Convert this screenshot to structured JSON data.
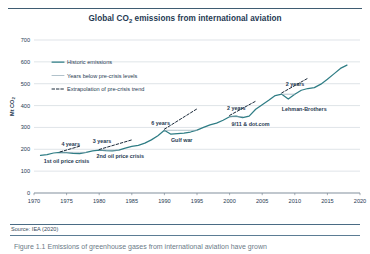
{
  "figure": {
    "title": "Global CO2 emissions from international aviation",
    "title_main": "Global CO",
    "title_sub": "2",
    "title_rest": " emissions from international aviation",
    "source": "Source: IEA (2020)",
    "caption": "Figure 1.1 Emissions of greenhouse gases from international aviation have grown",
    "accent_color": "#2f7d85",
    "line_color": "#2f7d85",
    "dash_color": "#1b2a3a",
    "grid_color": "#c9d2d9",
    "text_color": "#1f3a52"
  },
  "chart_data": {
    "type": "line",
    "title": "Global CO2 emissions from international aviation",
    "xlabel": "",
    "ylabel": "Mt CO2",
    "ylabel_main": "Mt CO",
    "ylabel_sub": "2",
    "xlim": [
      1970,
      2020
    ],
    "ylim": [
      0,
      700
    ],
    "xticks": [
      1970,
      1975,
      1980,
      1985,
      1990,
      1995,
      2000,
      2005,
      2010,
      2015,
      2020
    ],
    "yticks": [
      0,
      100,
      200,
      300,
      400,
      500,
      600,
      700
    ],
    "grid": "horizontal",
    "legend_position": "upper-left",
    "legend": [
      {
        "label": "Historic emissions",
        "style": "solid",
        "color": "#2f7d85"
      },
      {
        "label": "Years below pre-crisis levels",
        "style": "solid-thin",
        "color": "#8fa7b4"
      },
      {
        "label": "Extrapolation of pre-crisis trend",
        "style": "dashed",
        "color": "#1b2a3a"
      }
    ],
    "series": [
      {
        "name": "Historic emissions",
        "style": "solid",
        "color": "#2f7d85",
        "x": [
          1971,
          1972,
          1973,
          1974,
          1975,
          1976,
          1977,
          1978,
          1979,
          1980,
          1981,
          1982,
          1983,
          1984,
          1985,
          1986,
          1987,
          1988,
          1989,
          1990,
          1991,
          1992,
          1993,
          1994,
          1995,
          1996,
          1997,
          1998,
          1999,
          2000,
          2001,
          2002,
          2003,
          2004,
          2005,
          2006,
          2007,
          2008,
          2009,
          2010,
          2011,
          2012,
          2013,
          2014,
          2015,
          2016,
          2017,
          2018
        ],
        "y": [
          172,
          176,
          183,
          186,
          185,
          181,
          180,
          186,
          193,
          196,
          194,
          193,
          196,
          205,
          213,
          218,
          228,
          243,
          262,
          287,
          269,
          272,
          274,
          279,
          288,
          300,
          312,
          320,
          333,
          349,
          352,
          345,
          352,
          383,
          404,
          424,
          446,
          452,
          430,
          452,
          470,
          478,
          482,
          498,
          520,
          545,
          570,
          585
        ]
      },
      {
        "name": "Years below pre-crisis levels (1st oil price crisis)",
        "style": "solid-thin",
        "color": "#8fa7b4",
        "x": [
          1974,
          1975,
          1976,
          1977,
          1978
        ],
        "y": [
          186,
          186,
          186,
          186,
          186
        ]
      },
      {
        "name": "Years below pre-crisis levels (2nd oil price crisis)",
        "style": "solid-thin",
        "color": "#8fa7b4",
        "x": [
          1980,
          1981,
          1982,
          1983
        ],
        "y": [
          196,
          196,
          196,
          196
        ]
      },
      {
        "name": "Years below pre-crisis levels (Gulf war)",
        "style": "solid-thin",
        "color": "#8fa7b4",
        "x": [
          1990,
          1991,
          1992,
          1993,
          1994,
          1995
        ],
        "y": [
          287,
          287,
          287,
          287,
          287,
          287
        ]
      },
      {
        "name": "Years below pre-crisis levels (9/11 & dot.com)",
        "style": "solid-thin",
        "color": "#8fa7b4",
        "x": [
          2000,
          2001,
          2002
        ],
        "y": [
          349,
          349,
          349
        ]
      },
      {
        "name": "Years below pre-crisis levels (Lehman-Brothers)",
        "style": "solid-thin",
        "color": "#8fa7b4",
        "x": [
          2008,
          2009,
          2010
        ],
        "y": [
          452,
          452,
          452
        ]
      },
      {
        "name": "Extrapolation of pre-crisis trend (1st oil price crisis)",
        "style": "dashed",
        "color": "#1b2a3a",
        "x": [
          1974,
          1977
        ],
        "y": [
          188,
          214
        ]
      },
      {
        "name": "Extrapolation of pre-crisis trend (2nd oil price crisis)",
        "style": "dashed",
        "color": "#1b2a3a",
        "x": [
          1980,
          1985
        ],
        "y": [
          199,
          243
        ]
      },
      {
        "name": "Extrapolation of pre-crisis trend (Gulf war)",
        "style": "dashed",
        "color": "#1b2a3a",
        "x": [
          1990,
          1995
        ],
        "y": [
          292,
          385
        ]
      },
      {
        "name": "Extrapolation of pre-crisis trend (9/11 & dot.com)",
        "style": "dashed",
        "color": "#1b2a3a",
        "x": [
          2000,
          2004
        ],
        "y": [
          355,
          420
        ]
      },
      {
        "name": "Extrapolation of pre-crisis trend (Lehman-Brothers)",
        "style": "dashed",
        "color": "#1b2a3a",
        "x": [
          2008,
          2012
        ],
        "y": [
          458,
          525
        ]
      }
    ],
    "annotations": [
      {
        "text": "4 years",
        "x": 1974.2,
        "y": 213,
        "bold": true
      },
      {
        "text": "3 years",
        "x": 1979.0,
        "y": 228,
        "bold": true
      },
      {
        "text": "6 years",
        "x": 1988.0,
        "y": 310,
        "bold": true
      },
      {
        "text": "2 years",
        "x": 1999.6,
        "y": 382,
        "bold": true
      },
      {
        "text": "2 years",
        "x": 2008.6,
        "y": 490,
        "bold": true
      },
      {
        "text": "1st oil price crisis",
        "x": 1971.5,
        "y": 138,
        "bold": true
      },
      {
        "text": "2nd oil price crisis",
        "x": 1979.6,
        "y": 158,
        "bold": true
      },
      {
        "text": "Gulf war",
        "x": 1991.0,
        "y": 232,
        "bold": true
      },
      {
        "text": "9/11 & dot.com",
        "x": 2000.3,
        "y": 305,
        "bold": true
      },
      {
        "text": "Lehman-Brothers",
        "x": 2008.0,
        "y": 373,
        "bold": true
      }
    ]
  }
}
